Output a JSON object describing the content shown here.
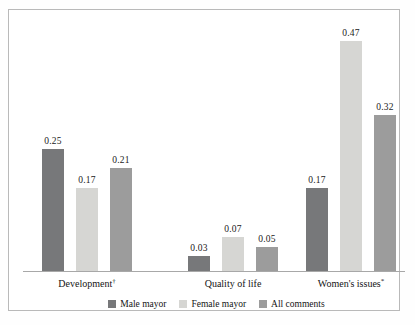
{
  "chart_data": {
    "type": "bar",
    "title": "",
    "subtitle": "",
    "xlabel": "",
    "ylabel": "",
    "ylim": [
      0,
      0.5
    ],
    "grid": false,
    "legend_position": "bottom",
    "categories": [
      "Development",
      "Quality of life",
      "Women's issues"
    ],
    "category_marks": [
      "†",
      "",
      "*"
    ],
    "series": [
      {
        "name": "Male mayor",
        "color": "#77787a",
        "values": [
          0.25,
          0.03,
          0.17
        ],
        "labels": [
          "0.25",
          "0.03",
          "0.17"
        ]
      },
      {
        "name": "Female mayor",
        "color": "#d6d6d3",
        "values": [
          0.17,
          0.07,
          0.47
        ],
        "labels": [
          "0.17",
          "0.07",
          "0.47"
        ]
      },
      {
        "name": "All comments",
        "color": "#9c9c9c",
        "values": [
          0.21,
          0.05,
          0.32
        ],
        "labels": [
          "0.21",
          "0.05",
          "0.32"
        ]
      }
    ]
  },
  "legend": {
    "items": [
      {
        "label": "Male mayor",
        "color": "#77787a"
      },
      {
        "label": "Female mayor",
        "color": "#d6d6d3"
      },
      {
        "label": "All comments",
        "color": "#9c9c9c"
      }
    ]
  },
  "axis": {
    "baseline_color": "#a8a8a8"
  },
  "frame": {
    "border_color": "#b9b9b9",
    "background": "#ffffff"
  }
}
